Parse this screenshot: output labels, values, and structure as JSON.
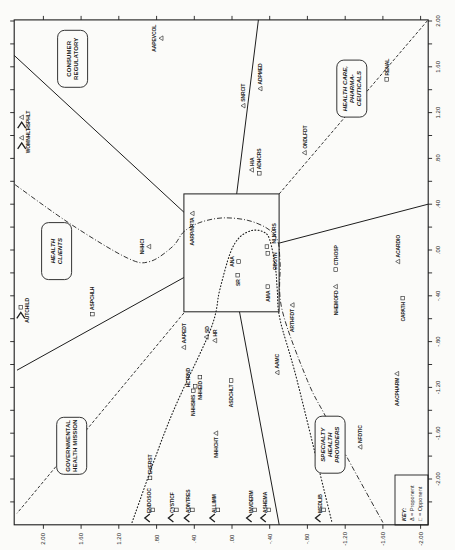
{
  "chart_data": {
    "type": "scatter",
    "title": "",
    "layout_hint": "figure printed rotated; all labels read bottom-to-top",
    "x_axis": {
      "position": "right",
      "label": "",
      "range": [
        -2.4,
        2.01
      ],
      "minor_step": 0.2,
      "tick_values": [
        2.0,
        1.6,
        1.2,
        0.8,
        0.4,
        0.0,
        -0.4,
        -0.8,
        -1.2,
        -1.6,
        -2.0
      ],
      "tick_labels": [
        "2.00",
        "1.60",
        "1.20",
        ".80",
        ".40",
        ".00",
        "-.40",
        "-.80",
        "-1.20",
        "-1.60",
        "-2.00"
      ]
    },
    "y_axis": {
      "position": "bottom",
      "label": "",
      "range": [
        -2.08,
        2.31
      ],
      "tick_values": [
        2.0,
        1.6,
        1.2,
        0.8,
        0.4,
        0.0,
        -0.4,
        -0.8,
        -1.2,
        -1.6,
        -2.0
      ],
      "tick_labels": [
        "2.00",
        "1.60",
        "1.20",
        ".80",
        ".40",
        ".00",
        "-.40",
        "-.80",
        "-1.20",
        "-1.60",
        "-2.00"
      ]
    },
    "grid": false,
    "legend": {
      "position": "bottom-right",
      "title": "KEY:",
      "entries": [
        {
          "symbol": "triangle",
          "text": "Δ = Proponent"
        },
        {
          "symbol": "square",
          "text": "□ = Opponent"
        }
      ]
    },
    "center_box": {
      "x": [
        -0.54,
        0.49
      ],
      "y": [
        -0.5,
        0.51
      ]
    },
    "regions": [
      {
        "name": "region-consumer-regulatory",
        "lines": [
          "CONSUMER",
          "REGULATORY"
        ],
        "x": 1.67,
        "y": 1.69,
        "italic": false
      },
      {
        "name": "region-health-clients",
        "lines": [
          "HEALTH",
          "CLIENTS"
        ],
        "x": -0.01,
        "y": 1.86,
        "italic": true
      },
      {
        "name": "region-governmental-health-mission",
        "lines": [
          "GOVERNMENTAL",
          "HEALTH MISSION"
        ],
        "x": -1.71,
        "y": 1.7,
        "italic": false
      },
      {
        "name": "region-specialty-health-providers",
        "lines": [
          "SPECIALTY",
          "HEALTH",
          "PROVIDERS"
        ],
        "x": -1.7,
        "y": -1.04,
        "italic": true
      },
      {
        "name": "region-health-care-pharmaceuticals",
        "lines": [
          "HEALTH CARE,",
          "PHARMA-",
          "CEUTICALS"
        ],
        "x": 1.41,
        "y": -1.27,
        "italic": true
      }
    ],
    "boundaries": [
      {
        "name": "boundary-solid-consumer-clients",
        "style": "solid",
        "points": [
          [
            1.7,
            2.31
          ],
          [
            0.33,
            0.51
          ]
        ]
      },
      {
        "name": "boundary-solid-consumer-upper",
        "style": "solid",
        "points": [
          [
            2.01,
            -0.28
          ],
          [
            0.49,
            -0.05
          ]
        ]
      },
      {
        "name": "boundary-solid-right",
        "style": "solid",
        "points": [
          [
            0.06,
            -0.5
          ],
          [
            0.4,
            -2.08
          ]
        ]
      },
      {
        "name": "boundary-solid-lower",
        "style": "solid",
        "points": [
          [
            -0.54,
            -0.08
          ],
          [
            -2.4,
            -0.5
          ]
        ]
      },
      {
        "name": "boundary-solid-clients-governmental",
        "style": "solid",
        "points": [
          [
            -1.05,
            2.28
          ],
          [
            -0.24,
            0.51
          ]
        ]
      },
      {
        "name": "boundary-dashed-health-care",
        "style": "dashed",
        "points": [
          [
            0.49,
            -0.5
          ],
          [
            2.01,
            -2.08
          ]
        ]
      },
      {
        "name": "boundary-dashed-governmental",
        "style": "dashed",
        "points": [
          [
            -0.55,
            0.51
          ],
          [
            -2.3,
            2.28
          ]
        ]
      },
      {
        "name": "boundary-dashdot-clients-specialty",
        "style": "dashdot",
        "smooth": true,
        "points": [
          [
            0.57,
            2.3
          ],
          [
            0.22,
            1.7
          ],
          [
            -0.07,
            1.11
          ],
          [
            -0.1,
            0.87
          ],
          [
            0.03,
            0.63
          ],
          [
            0.16,
            0.51
          ],
          [
            0.24,
            0.34
          ],
          [
            0.28,
            0.1
          ],
          [
            0.26,
            -0.16
          ],
          [
            0.19,
            -0.37
          ],
          [
            0.09,
            -0.48
          ],
          [
            -0.11,
            -0.51
          ],
          [
            -0.52,
            -0.53
          ],
          [
            -1.14,
            -0.8
          ],
          [
            -1.45,
            -0.99
          ],
          [
            -1.81,
            -1.22
          ],
          [
            -2.38,
            -1.6
          ]
        ]
      },
      {
        "name": "boundary-dotted-specialty",
        "style": "dotted",
        "smooth": true,
        "points": [
          [
            -2.38,
            1.06
          ],
          [
            -1.48,
            0.66
          ],
          [
            -0.7,
            0.23
          ],
          [
            -0.35,
            0.13
          ],
          [
            -0.03,
            0.02
          ],
          [
            0.11,
            -0.08
          ],
          [
            0.17,
            -0.21
          ],
          [
            0.16,
            -0.33
          ],
          [
            0.09,
            -0.4
          ],
          [
            -0.15,
            -0.46
          ],
          [
            -0.35,
            -0.48
          ],
          [
            -0.61,
            -0.51
          ],
          [
            -1.14,
            -0.69
          ],
          [
            -2.38,
            -1.06
          ]
        ]
      }
    ],
    "series": [
      {
        "name": "Proponent",
        "marker": "triangle",
        "points": [
          {
            "label": "AAPEVCOL",
            "x": 1.85,
            "y": 0.75,
            "pos": "left"
          },
          {
            "label": "WOMNHLT",
            "x": 0.98,
            "y": 2.23,
            "pos": "right",
            "offscale": "left"
          },
          {
            "label": "HSPHLT",
            "x": 1.16,
            "y": 2.23,
            "pos": "right",
            "offscale": "left"
          },
          {
            "label": "SNRCIT",
            "x": 1.26,
            "y": -0.12,
            "pos": "above"
          },
          {
            "label": "ADPMED",
            "x": 1.41,
            "y": -0.3,
            "pos": "above"
          },
          {
            "label": "HIA",
            "x": 0.7,
            "y": -0.21,
            "pos": "above"
          },
          {
            "label": "ONDLFDT",
            "x": 0.85,
            "y": -0.77,
            "pos": "above"
          },
          {
            "label": "NHHCI",
            "x": 0.03,
            "y": 0.88,
            "pos": "left"
          },
          {
            "label": "AARP/NRTA",
            "x": 0.32,
            "y": 0.42,
            "pos": "below"
          },
          {
            "label": "ARTHFDT",
            "x": -0.48,
            "y": -0.64,
            "pos": "below"
          },
          {
            "label": "NHEMOFD",
            "x": -0.32,
            "y": -1.1,
            "pos": "below"
          },
          {
            "label": "ACARDIO",
            "x": -0.1,
            "y": -1.76,
            "pos": "above"
          },
          {
            "label": "AACPHARM",
            "x": -1.08,
            "y": -1.75,
            "pos": "below"
          },
          {
            "label": "AAPEDT",
            "x": -0.85,
            "y": 0.51,
            "pos": "above"
          },
          {
            "label": "SD",
            "x": -0.76,
            "y": 0.27,
            "pos": "above"
          },
          {
            "label": "HR",
            "x": -0.79,
            "y": 0.18,
            "pos": "above"
          },
          {
            "label": "NHHCHT",
            "x": -1.6,
            "y": 0.17,
            "pos": "below"
          },
          {
            "label": "AAMC",
            "x": -1.07,
            "y": -0.48,
            "pos": "above"
          },
          {
            "label": "NFDTIC",
            "x": -1.72,
            "y": -1.36,
            "pos": "above"
          }
        ]
      },
      {
        "name": "Opponent",
        "marker": "square",
        "points": [
          {
            "label": "RENAL",
            "x": 1.49,
            "y": -1.64,
            "pos": "above"
          },
          {
            "label": "ADHCRS",
            "x": 0.67,
            "y": -0.29,
            "pos": "above"
          },
          {
            "label": "AUTCHILD",
            "x": -0.5,
            "y": 2.24,
            "pos": "right",
            "offscale": "left"
          },
          {
            "label": "ASPCHLH",
            "x": -0.56,
            "y": 1.48,
            "pos": "above"
          },
          {
            "label": "ANA",
            "x": -0.1,
            "y": -0.07,
            "pos": "left"
          },
          {
            "label": "SR",
            "x": -0.22,
            "y": -0.06,
            "pos": "below"
          },
          {
            "label": "AMA",
            "x": -0.32,
            "y": -0.38,
            "pos": "below"
          },
          {
            "label": "NLNURS",
            "x": 0.03,
            "y": -0.37,
            "pos": "above-right"
          },
          {
            "label": "OBGYN",
            "x": -0.03,
            "y": -0.38,
            "pos": "below-right"
          },
          {
            "label": "CTHOSP",
            "x": -0.17,
            "y": -1.1,
            "pos": "above"
          },
          {
            "label": "CAPATH",
            "x": -0.42,
            "y": -1.81,
            "pos": "below"
          },
          {
            "label": "HLTPND",
            "x": -1.19,
            "y": 0.39,
            "pos": "above-left"
          },
          {
            "label": "NHHSMS",
            "x": -1.23,
            "y": 0.41,
            "pos": "below"
          },
          {
            "label": "NHHEID",
            "x": -1.11,
            "y": 0.34,
            "pos": "below"
          },
          {
            "label": "ASDCHLT",
            "x": -1.14,
            "y": 0.01,
            "pos": "below"
          },
          {
            "label": "EVERST",
            "x": -1.99,
            "y": 0.87,
            "pos": "above"
          },
          {
            "label": "ENDOSOC",
            "x": -2.27,
            "y": 0.84,
            "pos": "left-up",
            "offscale": "bottom"
          },
          {
            "label": "CYSTICF",
            "x": -2.27,
            "y": 0.59,
            "pos": "left-up",
            "offscale": "bottom"
          },
          {
            "label": "ADNTRES",
            "x": -2.27,
            "y": 0.42,
            "pos": "left-up",
            "offscale": "bottom"
          },
          {
            "label": "ALLIMM",
            "x": -2.27,
            "y": 0.15,
            "pos": "left-up",
            "offscale": "bottom"
          },
          {
            "label": "INVDERM",
            "x": -2.27,
            "y": -0.24,
            "pos": "left-up",
            "offscale": "bottom"
          },
          {
            "label": "ASHEMA",
            "x": -2.27,
            "y": -0.39,
            "pos": "left-up",
            "offscale": "bottom"
          },
          {
            "label": "MEDLIB",
            "x": -2.27,
            "y": -0.97,
            "pos": "left-up",
            "offscale": "bottom"
          }
        ]
      }
    ]
  }
}
